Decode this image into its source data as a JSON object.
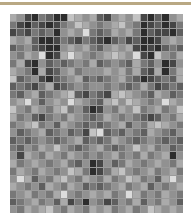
{
  "figure": {
    "type": "grayscale-mosaic",
    "columns": 24,
    "rows": 26,
    "top_rule_color": "#b9a883",
    "gridline_color": "#9a9a9a",
    "scale_note": "0=black, 9=white",
    "cells": [
      [
        6,
        5,
        2,
        1,
        4,
        3,
        1,
        1,
        7,
        6,
        5,
        6,
        3,
        2,
        5,
        6,
        5,
        7,
        2,
        1,
        3,
        1,
        5,
        6
      ],
      [
        4,
        2,
        1,
        3,
        2,
        1,
        2,
        4,
        5,
        7,
        6,
        5,
        4,
        5,
        6,
        7,
        5,
        4,
        1,
        2,
        3,
        1,
        2,
        4
      ],
      [
        2,
        3,
        2,
        4,
        3,
        4,
        1,
        5,
        6,
        5,
        8,
        4,
        3,
        4,
        6,
        5,
        6,
        4,
        1,
        3,
        2,
        2,
        1,
        3
      ],
      [
        6,
        5,
        6,
        3,
        1,
        1,
        2,
        4,
        3,
        2,
        4,
        3,
        2,
        1,
        3,
        4,
        2,
        3,
        1,
        1,
        2,
        5,
        6,
        5
      ],
      [
        3,
        4,
        5,
        3,
        2,
        1,
        1,
        5,
        6,
        5,
        6,
        4,
        3,
        5,
        6,
        5,
        6,
        2,
        1,
        2,
        1,
        3,
        4,
        3
      ],
      [
        5,
        4,
        6,
        5,
        8,
        1,
        2,
        6,
        8,
        6,
        5,
        4,
        5,
        6,
        7,
        6,
        5,
        8,
        2,
        1,
        7,
        5,
        4,
        6
      ],
      [
        4,
        6,
        2,
        1,
        5,
        3,
        4,
        3,
        4,
        5,
        4,
        6,
        3,
        4,
        5,
        4,
        3,
        6,
        4,
        3,
        5,
        1,
        2,
        5
      ],
      [
        6,
        5,
        4,
        1,
        6,
        2,
        3,
        5,
        6,
        4,
        5,
        5,
        5,
        6,
        5,
        6,
        4,
        6,
        3,
        2,
        6,
        1,
        4,
        6
      ],
      [
        7,
        3,
        4,
        5,
        2,
        1,
        3,
        4,
        5,
        6,
        3,
        4,
        3,
        4,
        5,
        6,
        4,
        3,
        1,
        2,
        3,
        4,
        3,
        6
      ],
      [
        3,
        4,
        3,
        2,
        4,
        6,
        2,
        3,
        4,
        5,
        4,
        5,
        5,
        4,
        5,
        4,
        3,
        4,
        6,
        4,
        2,
        3,
        4,
        3
      ],
      [
        4,
        3,
        5,
        6,
        3,
        4,
        5,
        6,
        7,
        3,
        2,
        4,
        3,
        2,
        6,
        7,
        6,
        5,
        4,
        3,
        6,
        5,
        3,
        4
      ],
      [
        5,
        6,
        8,
        5,
        3,
        5,
        6,
        5,
        8,
        6,
        5,
        4,
        3,
        6,
        7,
        5,
        7,
        6,
        5,
        4,
        5,
        8,
        6,
        5
      ],
      [
        7,
        5,
        4,
        6,
        5,
        4,
        6,
        7,
        4,
        5,
        3,
        1,
        2,
        5,
        4,
        6,
        5,
        7,
        4,
        5,
        6,
        4,
        5,
        7
      ],
      [
        6,
        4,
        5,
        3,
        2,
        4,
        5,
        4,
        6,
        5,
        4,
        3,
        4,
        6,
        5,
        4,
        5,
        4,
        3,
        2,
        3,
        5,
        4,
        6
      ],
      [
        4,
        5,
        6,
        7,
        4,
        5,
        3,
        6,
        5,
        4,
        3,
        4,
        3,
        4,
        5,
        6,
        3,
        5,
        4,
        6,
        7,
        6,
        5,
        4
      ],
      [
        5,
        3,
        4,
        5,
        6,
        3,
        4,
        5,
        3,
        4,
        2,
        7,
        8,
        3,
        4,
        3,
        5,
        4,
        3,
        6,
        5,
        4,
        3,
        5
      ],
      [
        3,
        4,
        3,
        4,
        5,
        4,
        3,
        4,
        5,
        6,
        3,
        4,
        3,
        4,
        6,
        5,
        4,
        3,
        4,
        5,
        4,
        3,
        4,
        3
      ],
      [
        4,
        3,
        5,
        4,
        6,
        5,
        7,
        5,
        4,
        3,
        4,
        5,
        6,
        4,
        3,
        4,
        5,
        7,
        5,
        6,
        4,
        5,
        3,
        4
      ],
      [
        5,
        2,
        6,
        5,
        4,
        6,
        5,
        4,
        6,
        5,
        4,
        5,
        4,
        5,
        6,
        4,
        5,
        4,
        6,
        4,
        5,
        6,
        1,
        5
      ],
      [
        6,
        4,
        5,
        6,
        5,
        4,
        5,
        6,
        4,
        3,
        5,
        1,
        2,
        5,
        3,
        4,
        6,
        5,
        4,
        5,
        6,
        5,
        4,
        6
      ],
      [
        4,
        6,
        5,
        4,
        6,
        5,
        4,
        5,
        7,
        6,
        4,
        1,
        2,
        4,
        6,
        7,
        5,
        4,
        5,
        6,
        4,
        5,
        6,
        4
      ],
      [
        5,
        8,
        6,
        3,
        5,
        4,
        6,
        7,
        5,
        4,
        6,
        5,
        4,
        6,
        4,
        5,
        7,
        6,
        4,
        5,
        3,
        6,
        8,
        5
      ],
      [
        6,
        5,
        4,
        5,
        3,
        6,
        5,
        4,
        6,
        5,
        3,
        4,
        3,
        4,
        5,
        6,
        4,
        5,
        6,
        3,
        5,
        4,
        5,
        6
      ],
      [
        4,
        5,
        6,
        4,
        5,
        4,
        6,
        8,
        5,
        4,
        5,
        6,
        5,
        6,
        4,
        5,
        8,
        6,
        4,
        5,
        4,
        6,
        5,
        4
      ],
      [
        3,
        4,
        5,
        6,
        4,
        5,
        3,
        6,
        2,
        4,
        1,
        5,
        4,
        2,
        3,
        5,
        4,
        6,
        3,
        5,
        4,
        6,
        5,
        3
      ],
      [
        5,
        4,
        6,
        5,
        6,
        7,
        5,
        4,
        6,
        5,
        4,
        6,
        5,
        6,
        4,
        5,
        6,
        4,
        5,
        7,
        6,
        5,
        6,
        5
      ]
    ]
  }
}
